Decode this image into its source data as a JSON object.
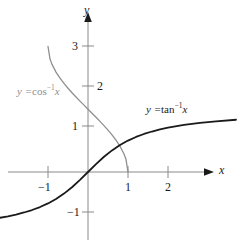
{
  "chart_data": {
    "type": "line",
    "title": "",
    "xlabel": "x",
    "ylabel": "y",
    "xlim": [
      -2.2,
      3.7
    ],
    "ylim": [
      -1.9,
      4.3
    ],
    "grid": false,
    "legend_position": "inline-annotations",
    "x_ticks": [
      -1,
      1,
      2
    ],
    "x_tick_labels": [
      "−1",
      "1",
      "2"
    ],
    "y_ticks": [
      -1,
      1,
      2,
      3
    ],
    "y_tick_labels": [
      "−1",
      "1",
      "2",
      "3"
    ],
    "series": [
      {
        "name": "y = cos⁻¹ x",
        "color": "#8f8f8f",
        "domain": [
          -1,
          1
        ],
        "range": [
          0,
          3.14159
        ],
        "x": [
          -1.0,
          -0.95,
          -0.9,
          -0.8,
          -0.7,
          -0.6,
          -0.5,
          -0.4,
          -0.3,
          -0.2,
          -0.1,
          0.0,
          0.1,
          0.2,
          0.3,
          0.4,
          0.5,
          0.6,
          0.7,
          0.8,
          0.9,
          0.95,
          1.0
        ],
        "values": [
          3.1416,
          2.8247,
          2.6906,
          2.4981,
          2.3462,
          2.2143,
          2.0944,
          1.9823,
          1.8755,
          1.7722,
          1.671,
          1.5708,
          1.4706,
          1.3694,
          1.2661,
          1.1593,
          1.0472,
          0.9273,
          0.7954,
          0.6435,
          0.451,
          0.3176,
          0.0
        ]
      },
      {
        "name": "y = tan⁻¹ x",
        "color": "#1a1a1a",
        "domain": [
          -2.2,
          3.7
        ],
        "range": [
          -1.144,
          1.307
        ],
        "x": [
          -2.2,
          -2.0,
          -1.8,
          -1.6,
          -1.4,
          -1.2,
          -1.0,
          -0.8,
          -0.6,
          -0.4,
          -0.2,
          0.0,
          0.2,
          0.4,
          0.6,
          0.8,
          1.0,
          1.2,
          1.4,
          1.6,
          1.8,
          2.0,
          2.4,
          2.8,
          3.2,
          3.7
        ],
        "values": [
          -1.1442,
          -1.1071,
          -1.0637,
          -1.0122,
          -0.9505,
          -0.8761,
          -0.7854,
          -0.6747,
          -0.5404,
          -0.3805,
          -0.1974,
          0.0,
          0.1974,
          0.3805,
          0.5404,
          0.6747,
          0.7854,
          0.8761,
          0.9505,
          1.0122,
          1.0637,
          1.1071,
          1.176,
          1.2278,
          1.2679,
          1.3068
        ]
      }
    ],
    "annotations": [
      {
        "id": "arccos-label",
        "text_parts": {
          "lhs": "y =",
          "fn": "cos",
          "exp": "−1",
          "arg": "x"
        },
        "full_text": "y = cos⁻¹ x",
        "color": "#8f8f8f"
      },
      {
        "id": "arctan-label",
        "text_parts": {
          "lhs": "y =",
          "fn": "tan",
          "exp": "−1",
          "arg": "x"
        },
        "full_text": "y = tan⁻¹ x",
        "color": "#1a1a1a"
      }
    ],
    "axis_color": "#8a8a8a"
  },
  "labels": {
    "x_axis_name": "x",
    "y_axis_name": "y",
    "x_tick_neg1": "−1",
    "x_tick_1": "1",
    "x_tick_2": "2",
    "y_tick_neg1": "−1",
    "y_tick_1": "1",
    "y_tick_2": "2",
    "y_tick_3": "3",
    "arccos_lhs": "y =",
    "arccos_fn": "cos",
    "arccos_exp": "−1",
    "arccos_arg": "x",
    "arctan_lhs": "y =",
    "arctan_fn": "tan",
    "arctan_exp": "−1",
    "arctan_arg": "x"
  }
}
